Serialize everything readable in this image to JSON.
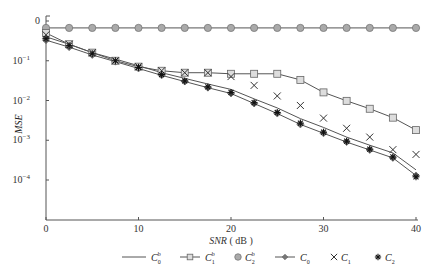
{
  "chart_data": {
    "type": "line",
    "title": "",
    "xlabel": "SNR (dB)",
    "ylabel": "MSE",
    "yscale": "log",
    "xlim": [
      0,
      40
    ],
    "ylim": [
      2e-05,
      1
    ],
    "x_ticks": [
      "0",
      "10",
      "20",
      "30",
      "40"
    ],
    "y_ticks": [
      "0",
      "10^-1",
      "10^-2",
      "10^-3",
      "10^-4"
    ],
    "x": [
      0,
      2.5,
      5,
      7.5,
      10,
      12.5,
      15,
      17.5,
      20,
      22.5,
      25,
      27.5,
      30,
      32.5,
      35,
      37.5,
      40
    ],
    "series": [
      {
        "name": "C0^b",
        "marker": "none",
        "line": true,
        "values": [
          0.4,
          0.26,
          0.16,
          0.11,
          0.075,
          0.05,
          0.036,
          0.026,
          0.019,
          0.011,
          0.0065,
          0.0035,
          0.0021,
          0.0012,
          0.00075,
          0.00048,
          0.00018
        ]
      },
      {
        "name": "C1^b",
        "marker": "square",
        "line": true,
        "values": [
          0.5,
          0.26,
          0.16,
          0.1,
          0.071,
          0.056,
          0.05,
          0.05,
          0.047,
          0.047,
          0.047,
          0.033,
          0.016,
          0.0098,
          0.0062,
          0.0037,
          0.0018
        ]
      },
      {
        "name": "C2^b",
        "marker": "circle",
        "line": true,
        "values": [
          0.67,
          0.67,
          0.67,
          0.67,
          0.67,
          0.67,
          0.67,
          0.67,
          0.67,
          0.67,
          0.67,
          0.67,
          0.67,
          0.67,
          0.67,
          0.67,
          0.67
        ]
      },
      {
        "name": "C0",
        "marker": "diamond",
        "line": true,
        "values": [
          0.33,
          0.22,
          0.14,
          0.095,
          0.064,
          0.043,
          0.03,
          0.021,
          0.015,
          0.0084,
          0.0047,
          0.0025,
          0.0015,
          0.0009,
          0.00057,
          0.00036,
          0.00013
        ]
      },
      {
        "name": "C1",
        "marker": "x",
        "line": false,
        "values": [
          0.45,
          0.26,
          0.16,
          0.1,
          0.071,
          0.056,
          0.05,
          0.05,
          0.04,
          0.024,
          0.013,
          0.0075,
          0.0036,
          0.002,
          0.0012,
          0.00058,
          0.00044
        ]
      },
      {
        "name": "C2",
        "marker": "star",
        "line": false,
        "values": [
          0.36,
          0.24,
          0.15,
          0.1,
          0.068,
          0.045,
          0.031,
          0.022,
          0.016,
          0.0088,
          0.005,
          0.0027,
          0.0016,
          0.00095,
          0.0006,
          0.00038,
          0.00012
        ]
      }
    ],
    "legend_position": "bottom",
    "grid": false
  },
  "legend": [
    {
      "base": "C",
      "sub": "0",
      "sup": "b"
    },
    {
      "base": "C",
      "sub": "1",
      "sup": "b"
    },
    {
      "base": "C",
      "sub": "2",
      "sup": "b"
    },
    {
      "base": "C",
      "sub": "0",
      "sup": ""
    },
    {
      "base": "C",
      "sub": "1",
      "sup": ""
    },
    {
      "base": "C",
      "sub": "2",
      "sup": ""
    }
  ],
  "axes": {
    "xlabel": "SNR",
    "xunit": "( dB )",
    "ylabel": "MSE"
  }
}
